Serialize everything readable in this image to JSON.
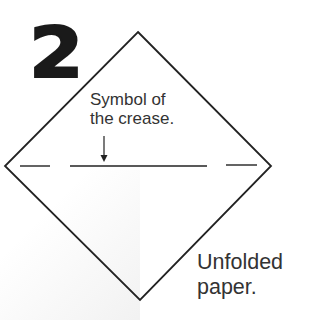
{
  "step": {
    "number": "2"
  },
  "annotations": {
    "crease_symbol": {
      "line1": "Symbol of",
      "line2": "the crease."
    },
    "paper": {
      "line1": "Unfolded",
      "line2": "paper."
    }
  },
  "diagram": {
    "shape": "diamond",
    "vertices": {
      "top": [
        138,
        32
      ],
      "right": [
        271,
        166
      ],
      "bottom": [
        140,
        300
      ],
      "left": [
        5,
        166
      ]
    },
    "crease_line_y": 166,
    "crease_segments": [
      [
        20,
        50
      ],
      [
        70,
        207
      ],
      [
        226,
        257
      ]
    ],
    "arrow": {
      "x": 104,
      "y_start": 136,
      "y_end": 162
    },
    "stroke_color": "#222222"
  }
}
